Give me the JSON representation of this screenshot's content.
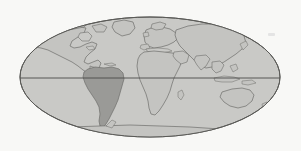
{
  "figure": {
    "name": "world-map"
  },
  "projection": {
    "type": "mollweide-ellipse",
    "center_x": 150,
    "center_y": 77,
    "radius_x": 130,
    "radius_y": 60
  },
  "colors": {
    "background": "#f8f8f6",
    "ocean_fill": "#c9c9c6",
    "land_fill": "#c4c4c1",
    "highlight_fill": "#9a9a97",
    "coastline_stroke": "#6e6e6b",
    "ellipse_stroke": "#5a5a57",
    "equator_stroke": "#4a4a48"
  },
  "graticule": {
    "equator_label": "Equator",
    "equator_y": 78,
    "lines_visible": 1
  },
  "highlight": {
    "region": "South America",
    "shaded": true
  },
  "landmasses": [
    {
      "name": "north-america",
      "label": "North America",
      "highlighted": false
    },
    {
      "name": "greenland",
      "label": "Greenland",
      "highlighted": false
    },
    {
      "name": "south-america",
      "label": "South America",
      "highlighted": true
    },
    {
      "name": "europe",
      "label": "Europe",
      "highlighted": false
    },
    {
      "name": "africa",
      "label": "Africa",
      "highlighted": false
    },
    {
      "name": "asia",
      "label": "Asia",
      "highlighted": false
    },
    {
      "name": "australia",
      "label": "Australia",
      "highlighted": false
    },
    {
      "name": "antarctica",
      "label": "Antarctica",
      "highlighted": false
    }
  ]
}
